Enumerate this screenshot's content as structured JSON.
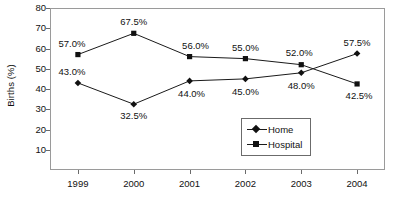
{
  "chart_data": {
    "type": "line",
    "title": "",
    "xlabel": "",
    "ylabel": "Births (%)",
    "categories": [
      "1999",
      "2000",
      "2001",
      "2002",
      "2003",
      "2004"
    ],
    "ylim": [
      0,
      80
    ],
    "ytick_values": [
      10,
      20,
      30,
      40,
      50,
      60,
      70,
      80
    ],
    "ytick_labels": [
      "10",
      "20",
      "30",
      "40",
      "50",
      "60",
      "70",
      "80"
    ],
    "grid": false,
    "legend_position": "inside-lower-right",
    "series": [
      {
        "name": "Home",
        "marker": "diamond",
        "values": [
          43.0,
          32.5,
          44.0,
          45.0,
          48.0,
          57.5
        ],
        "data_labels": [
          "43.0%",
          "32.5%",
          "44.0%",
          "45.0%",
          "48.0%",
          "57.5%"
        ]
      },
      {
        "name": "Hospital",
        "marker": "square",
        "values": [
          57.0,
          67.5,
          56.0,
          55.0,
          52.0,
          42.5
        ],
        "data_labels": [
          "57.0%",
          "67.5%",
          "56.0%",
          "55.0%",
          "52.0%",
          "42.5%"
        ]
      }
    ]
  },
  "legend": {
    "items": [
      {
        "label": "Home",
        "marker": "diamond"
      },
      {
        "label": "Hospital",
        "marker": "square"
      }
    ]
  },
  "colors": {
    "line": "#1a1a1a",
    "marker": "#111111",
    "frame": "#9a9a9a",
    "text": "#111111",
    "background": "#ffffff"
  }
}
